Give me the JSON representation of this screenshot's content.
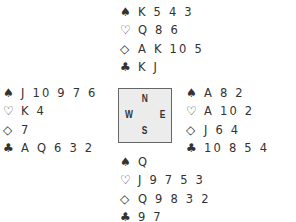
{
  "symbols": {
    "spades": "♠",
    "hearts": "♡",
    "diamonds": "◇",
    "clubs": "♣"
  },
  "compass": {
    "n": "N",
    "e": "E",
    "s": "S",
    "w": "W"
  },
  "hands": {
    "north": {
      "spades": "K 5 4 3",
      "hearts": "Q 8 6",
      "diamonds": "A K 10 5",
      "clubs": "K J"
    },
    "west": {
      "spades": "J 10 9 7 6",
      "hearts": "K 4",
      "diamonds": "7",
      "clubs": "A Q 6 3 2"
    },
    "east": {
      "spades": "A 8 2",
      "hearts": "A 10 2",
      "diamonds": "J 6 4",
      "clubs": "10 8 5 4"
    },
    "south": {
      "spades": "Q",
      "hearts": "J 9 7 5 3",
      "diamonds": "Q 9 8 3 2",
      "clubs": "9 7"
    }
  }
}
